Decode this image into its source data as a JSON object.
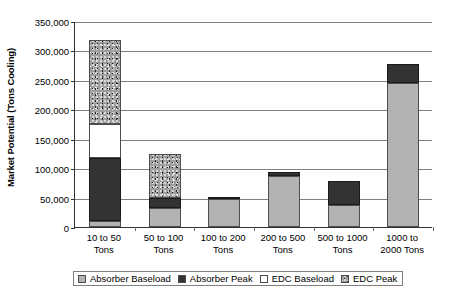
{
  "chart_data": {
    "type": "bar",
    "subtype": "stacked-bar",
    "title": "",
    "xlabel": "",
    "ylabel": "Market Potential (Tons Cooling)",
    "ylim": [
      0,
      350000
    ],
    "ytick_step": 50000,
    "grid": true,
    "legend_position": "bottom",
    "categories": [
      "10 to 50 Tons",
      "50 to 100 Tons",
      "100 to 200 Tons",
      "200 to 500 Tons",
      "500 to 1000 Tons",
      "1000 to 2000 Tons"
    ],
    "ytick_labels": [
      "350,000",
      "300,000",
      "250,000",
      "200,000",
      "150,000",
      "100,000",
      "50,000",
      "0"
    ],
    "ytick_values": [
      350000,
      300000,
      250000,
      200000,
      150000,
      100000,
      50000,
      0
    ],
    "series": [
      {
        "name": "Absorber Baseload",
        "pattern": "solid-light-gray",
        "color": "#b3b3b3",
        "values": [
          10000,
          33000,
          47000,
          87000,
          38000,
          245000
        ]
      },
      {
        "name": "Absorber Peak",
        "pattern": "solid-dark",
        "color": "#333333",
        "values": [
          107000,
          16000,
          2000,
          7000,
          40000,
          32000
        ]
      },
      {
        "name": "EDC Baseload",
        "pattern": "solid-white",
        "color": "#ffffff",
        "values": [
          58000,
          0,
          0,
          0,
          0,
          0
        ]
      },
      {
        "name": "EDC Peak",
        "pattern": "speckled-gray",
        "color": "#9e9e9e",
        "values": [
          142000,
          75000,
          0,
          0,
          0,
          0
        ]
      }
    ],
    "totals": [
      317000,
      124000,
      49000,
      94000,
      78000,
      277000
    ]
  }
}
